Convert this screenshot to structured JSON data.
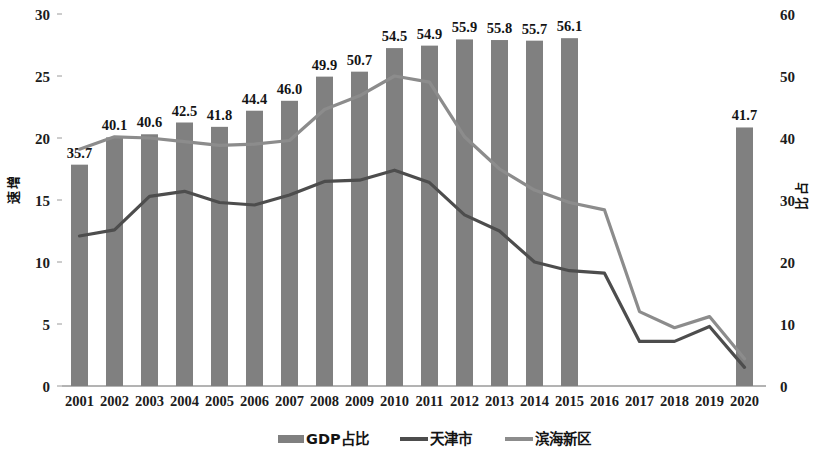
{
  "chart_data": {
    "type": "bar",
    "title": "",
    "subtitle": "",
    "xlabel": "",
    "ylabel": "增速",
    "y2label": "占比",
    "ylim": [
      0,
      30
    ],
    "y2lim": [
      0,
      60
    ],
    "ytick_labels": [
      "30",
      "25",
      "20",
      "15",
      "10",
      "5",
      "0"
    ],
    "yticks": [
      30,
      25,
      20,
      15,
      10,
      5,
      0
    ],
    "y2tick_labels": [
      "60",
      "50",
      "40",
      "30",
      "20",
      "10",
      "0"
    ],
    "y2ticks": [
      60,
      50,
      40,
      30,
      20,
      10,
      0
    ],
    "grid": false,
    "legend_position": "bottom",
    "categories": [
      "2001",
      "2002",
      "2003",
      "2004",
      "2005",
      "2006",
      "2007",
      "2008",
      "2009",
      "2010",
      "2011",
      "2012",
      "2013",
      "2014",
      "2015",
      "2016",
      "2017",
      "2018",
      "2019",
      "2020"
    ],
    "series": [
      {
        "name": "GDP占比",
        "type": "bar",
        "axis": "right",
        "color": "#808080",
        "values": [
          35.7,
          40.1,
          40.6,
          42.5,
          41.8,
          44.4,
          46.0,
          49.9,
          50.7,
          54.5,
          54.9,
          55.9,
          55.8,
          55.7,
          56.1,
          null,
          null,
          null,
          null,
          41.7
        ],
        "labels": [
          "35.7",
          "40.1",
          "40.6",
          "42.5",
          "41.8",
          "44.4",
          "46.0",
          "49.9",
          "50.7",
          "54.5",
          "54.9",
          "55.9",
          "55.8",
          "55.7",
          "56.1",
          "",
          "",
          "",
          "",
          "41.7"
        ]
      },
      {
        "name": "天津市",
        "type": "line",
        "axis": "left",
        "color": "#4d4d4d",
        "values": [
          12.1,
          12.6,
          15.3,
          15.7,
          14.8,
          14.6,
          15.4,
          16.5,
          16.6,
          17.4,
          16.4,
          13.8,
          12.5,
          10.0,
          9.3,
          9.1,
          3.6,
          3.6,
          4.8,
          1.5
        ]
      },
      {
        "name": "滨海新区",
        "type": "line",
        "axis": "left",
        "color": "#8c8c8c",
        "values": [
          19.1,
          20.1,
          20.0,
          19.7,
          19.4,
          19.5,
          19.8,
          22.3,
          23.4,
          25.0,
          24.5,
          20.1,
          17.5,
          15.8,
          14.8,
          14.2,
          6.0,
          4.7,
          5.6,
          2.2
        ]
      }
    ]
  },
  "legend": {
    "items": [
      {
        "label": "GDP占比",
        "marker": "bar-swatch",
        "color": "#808080"
      },
      {
        "label": "天津市",
        "marker": "line-swatch",
        "color": "#4d4d4d"
      },
      {
        "label": "滨海新区",
        "marker": "line-swatch",
        "color": "#8c8c8c"
      }
    ]
  }
}
